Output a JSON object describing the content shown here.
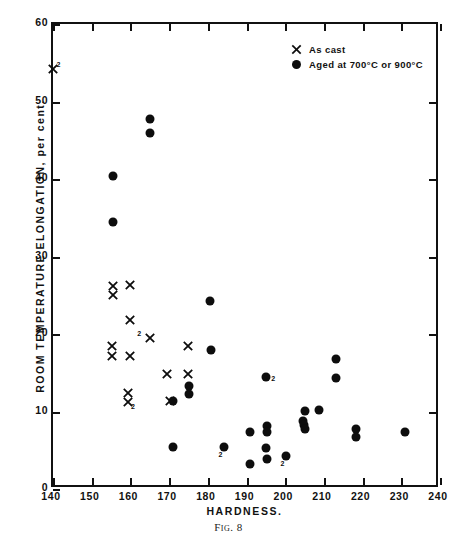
{
  "chart_data": {
    "type": "scatter",
    "title": "",
    "caption": "Fig. 8",
    "xlabel": "HARDNESS.",
    "ylabel": "ROOM TEMPERATURE ELONGATION, per cent.",
    "xlim": [
      140,
      240
    ],
    "ylim": [
      0,
      60
    ],
    "xticks": [
      140,
      150,
      160,
      170,
      180,
      190,
      200,
      210,
      220,
      230,
      240
    ],
    "yticks": [
      0,
      10,
      20,
      30,
      40,
      50,
      60
    ],
    "grid": false,
    "legend_position": "top-right",
    "legend": [
      {
        "marker": "cross",
        "label": "As cast"
      },
      {
        "marker": "dot",
        "label": "Aged at 700°C or 900°C"
      }
    ],
    "series": [
      {
        "name": "As cast",
        "marker": "cross",
        "points": [
          {
            "x": 140.0,
            "y": 54.2,
            "note": "2"
          },
          {
            "x": 155.5,
            "y": 26.2
          },
          {
            "x": 155.5,
            "y": 25.0
          },
          {
            "x": 159.8,
            "y": 26.3
          },
          {
            "x": 159.8,
            "y": 21.8
          },
          {
            "x": 165.0,
            "y": 19.5,
            "note": "2"
          },
          {
            "x": 155.3,
            "y": 18.4
          },
          {
            "x": 155.3,
            "y": 17.1
          },
          {
            "x": 159.8,
            "y": 17.2
          },
          {
            "x": 175.0,
            "y": 18.5
          },
          {
            "x": 169.5,
            "y": 14.9
          },
          {
            "x": 175.0,
            "y": 14.8
          },
          {
            "x": 159.5,
            "y": 12.4
          },
          {
            "x": 159.5,
            "y": 11.2,
            "note": "2"
          },
          {
            "x": 170.2,
            "y": 11.3
          }
        ]
      },
      {
        "name": "Aged at 700°C or 900°C",
        "marker": "dot",
        "points": [
          {
            "x": 165.0,
            "y": 47.8
          },
          {
            "x": 165.0,
            "y": 45.9
          },
          {
            "x": 155.5,
            "y": 40.4
          },
          {
            "x": 155.5,
            "y": 34.5
          },
          {
            "x": 180.5,
            "y": 24.3
          },
          {
            "x": 180.8,
            "y": 18.0
          },
          {
            "x": 213.2,
            "y": 16.8
          },
          {
            "x": 195.0,
            "y": 14.5,
            "note": "2"
          },
          {
            "x": 213.2,
            "y": 14.3
          },
          {
            "x": 175.2,
            "y": 13.3
          },
          {
            "x": 175.2,
            "y": 12.3
          },
          {
            "x": 171.0,
            "y": 11.3
          },
          {
            "x": 205.0,
            "y": 10.1
          },
          {
            "x": 208.8,
            "y": 10.2
          },
          {
            "x": 204.6,
            "y": 8.8
          },
          {
            "x": 204.8,
            "y": 8.2
          },
          {
            "x": 205.2,
            "y": 7.8
          },
          {
            "x": 195.2,
            "y": 8.1
          },
          {
            "x": 195.2,
            "y": 7.4
          },
          {
            "x": 191.0,
            "y": 7.4
          },
          {
            "x": 218.2,
            "y": 7.7
          },
          {
            "x": 218.2,
            "y": 6.7
          },
          {
            "x": 231.0,
            "y": 7.4
          },
          {
            "x": 171.0,
            "y": 5.4
          },
          {
            "x": 184.2,
            "y": 5.4,
            "note": "2"
          },
          {
            "x": 195.0,
            "y": 5.3
          },
          {
            "x": 195.2,
            "y": 3.9
          },
          {
            "x": 200.2,
            "y": 4.2,
            "note": "2"
          },
          {
            "x": 190.8,
            "y": 3.2
          }
        ]
      }
    ]
  }
}
